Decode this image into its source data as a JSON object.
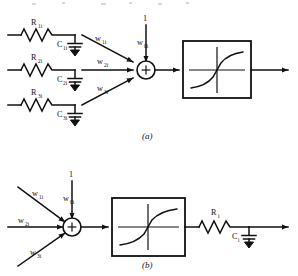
{
  "figure": {
    "caption_a": "(a)",
    "caption_b": "(b)",
    "node_symbol": "+"
  },
  "panel_a": {
    "branches": [
      {
        "resistor": "R",
        "resistor_sub": "1i",
        "capacitor": "C",
        "capacitor_sub": "1i",
        "weight": "w",
        "weight_sub": "1i"
      },
      {
        "resistor": "R",
        "resistor_sub": "2i",
        "capacitor": "C",
        "capacitor_sub": "2i",
        "weight": "w",
        "weight_sub": "2i"
      },
      {
        "resistor": "R",
        "resistor_sub": "3i",
        "capacitor": "C",
        "capacitor_sub": "3i",
        "weight": "w",
        "weight_sub": "3i"
      }
    ],
    "bias": {
      "value": "1",
      "weight": "w",
      "weight_sub": "0i"
    }
  },
  "panel_b": {
    "weights": [
      {
        "label": "w",
        "sub": "1i"
      },
      {
        "label": "w",
        "sub": "2i"
      },
      {
        "label": "w",
        "sub": "3i"
      }
    ],
    "bias": {
      "value": "1",
      "weight": "w",
      "weight_sub": "0i"
    },
    "output_filter": {
      "resistor": "R",
      "resistor_sub": "i",
      "capacitor": "C",
      "capacitor_sub": "i"
    }
  }
}
